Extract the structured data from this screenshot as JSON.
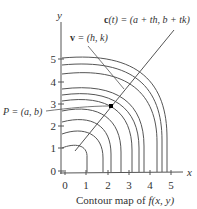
{
  "figure": {
    "caption": "Contour map of f(x, y)",
    "caption_parts": {
      "prefix": "Contour map of ",
      "func": "f",
      "args": "(x, y)"
    },
    "axes": {
      "x_label": "x",
      "y_label": "y",
      "x_ticks": [
        "0",
        "1",
        "2",
        "3",
        "4",
        "5"
      ],
      "y_ticks": [
        "0",
        "1",
        "2",
        "3",
        "4",
        "5"
      ]
    },
    "annotations": {
      "line_label": "c(t) = (a + th, b + tk)",
      "line_label_parts": {
        "c": "c",
        "t": "(t)",
        "rest": " = (a + th, b + tk)"
      },
      "vector_label": "v = (h, k)",
      "vector_label_parts": {
        "v": "v",
        "rest": " = (h, k)"
      },
      "point_label": "P = (a, b)"
    },
    "colors": {
      "line": "#555555",
      "text": "#333333",
      "point": "#000000"
    }
  }
}
